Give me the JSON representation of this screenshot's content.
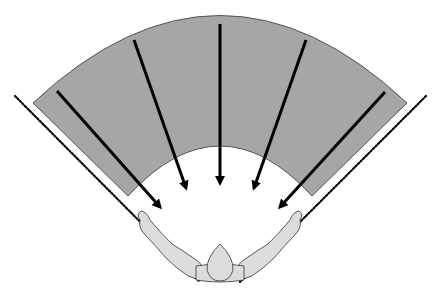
{
  "diagram": {
    "title": "",
    "colors": {
      "background": "#ffffff",
      "band_fill": "#a6a6a6",
      "band_stroke": "#555555",
      "arrow": "#000000",
      "dotted_line": "#000000",
      "figure_fill": "#dcdcdc",
      "figure_stroke": "#333333"
    },
    "band": {
      "shape": "annular-sector",
      "outer_arc": {
        "start": [
          33,
          103
        ],
        "apex": [
          220,
          15
        ],
        "end": [
          407,
          103
        ]
      },
      "inner_arc": {
        "start": [
          128,
          196
        ],
        "apex": [
          220,
          144
        ],
        "end": [
          312,
          196
        ]
      }
    },
    "arrows": [
      {
        "from": [
          57,
          91
        ],
        "to": [
          166,
          214
        ]
      },
      {
        "from": [
          134,
          40
        ],
        "to": [
          190,
          196
        ]
      },
      {
        "from": [
          220,
          24
        ],
        "to": [
          220,
          192
        ]
      },
      {
        "from": [
          306,
          40
        ],
        "to": [
          250,
          196
        ]
      },
      {
        "from": [
          385,
          92
        ],
        "to": [
          274,
          214
        ]
      }
    ],
    "dotted_lines": [
      {
        "from": [
          15,
          96
        ],
        "to": [
          200,
          282
        ]
      },
      {
        "from": [
          426,
          96
        ],
        "to": [
          240,
          282
        ]
      }
    ],
    "figure": {
      "description": "top-down view of a person with arms raised outward in a V shape",
      "head_center": [
        220,
        262
      ],
      "arms": [
        "left",
        "right"
      ]
    }
  }
}
